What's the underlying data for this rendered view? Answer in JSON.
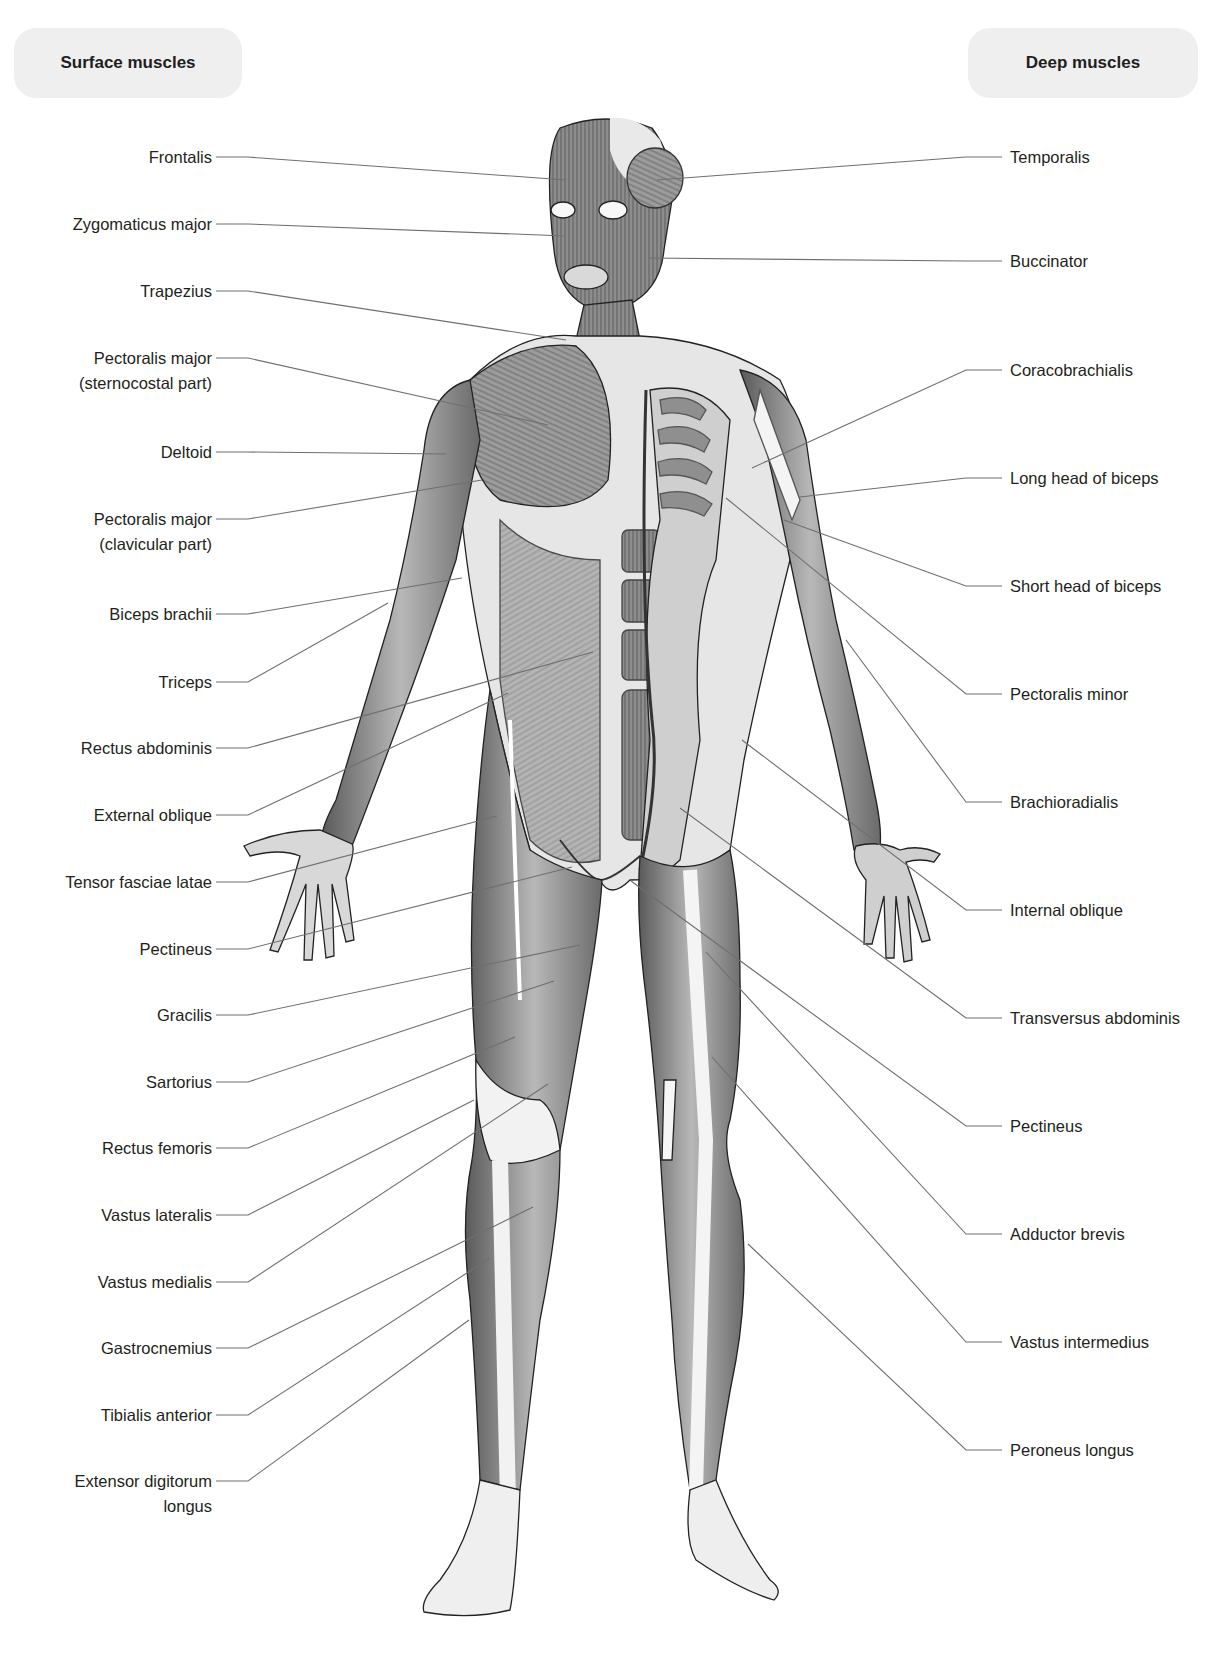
{
  "headers": {
    "left": "Surface muscles",
    "right": "Deep muscles"
  },
  "colors": {
    "pill_bg": "#efefef",
    "leader_line": "#6f6f6f",
    "label_text": "#231f20",
    "muscle_dark": "#5e5e5e",
    "muscle_mid": "#9a9a9a",
    "muscle_light": "#d6d6d6",
    "tendon": "#f4f4f4"
  },
  "surface_muscles": [
    {
      "label": "Frontalis",
      "y": 157,
      "target": [
        566,
        180
      ]
    },
    {
      "label": "Zygomaticus major",
      "y": 224,
      "target": [
        566,
        236
      ]
    },
    {
      "label": "Trapezius",
      "y": 291,
      "target": [
        566,
        340
      ]
    },
    {
      "label": "Pectoralis major",
      "label2": "(sternocostal part)",
      "y": 358,
      "target": [
        548,
        425
      ]
    },
    {
      "label": "Deltoid",
      "y": 452,
      "target": [
        446,
        454
      ]
    },
    {
      "label": "Pectoralis major",
      "label2": "(clavicular part)",
      "y": 519,
      "target": [
        482,
        480
      ]
    },
    {
      "label": "Biceps brachii",
      "y": 614,
      "target": [
        462,
        578
      ]
    },
    {
      "label": "Triceps",
      "y": 682,
      "target": [
        388,
        603
      ]
    },
    {
      "label": "Rectus abdominis",
      "y": 748,
      "target": [
        593,
        652
      ]
    },
    {
      "label": "External oblique",
      "y": 815,
      "target": [
        508,
        693
      ]
    },
    {
      "label": "Tensor fasciae latae",
      "y": 882,
      "target": [
        497,
        816
      ]
    },
    {
      "label": "Pectineus",
      "y": 949,
      "target": [
        572,
        867
      ]
    },
    {
      "label": "Gracilis",
      "y": 1015,
      "target": [
        580,
        945
      ]
    },
    {
      "label": "Sartorius",
      "y": 1082,
      "target": [
        554,
        981
      ]
    },
    {
      "label": "Rectus femoris",
      "y": 1148,
      "target": [
        515,
        1037
      ]
    },
    {
      "label": "Vastus lateralis",
      "y": 1215,
      "target": [
        474,
        1100
      ]
    },
    {
      "label": "Vastus medialis",
      "y": 1282,
      "target": [
        548,
        1084
      ]
    },
    {
      "label": "Gastrocnemius",
      "y": 1348,
      "target": [
        533,
        1207
      ]
    },
    {
      "label": "Tibialis anterior",
      "y": 1415,
      "target": [
        490,
        1258
      ]
    },
    {
      "label": "Extensor digitorum",
      "label2": "longus",
      "y": 1481,
      "target": [
        469,
        1320
      ]
    }
  ],
  "deep_muscles": [
    {
      "label": "Temporalis",
      "y": 157,
      "target": [
        657,
        180
      ]
    },
    {
      "label": "Buccinator",
      "y": 261,
      "target": [
        648,
        258
      ]
    },
    {
      "label": "Coracobrachialis",
      "y": 370,
      "target": [
        752,
        468
      ]
    },
    {
      "label": "Long head of biceps",
      "y": 478,
      "target": [
        800,
        497
      ]
    },
    {
      "label": "Short head of biceps",
      "y": 586,
      "target": [
        784,
        520
      ]
    },
    {
      "label": "Pectoralis minor",
      "y": 694,
      "target": [
        726,
        498
      ]
    },
    {
      "label": "Brachioradialis",
      "y": 802,
      "target": [
        846,
        640
      ]
    },
    {
      "label": "Internal oblique",
      "y": 910,
      "target": [
        742,
        740
      ]
    },
    {
      "label": "Transversus abdominis",
      "y": 1018,
      "target": [
        680,
        808
      ]
    },
    {
      "label": "Pectineus",
      "y": 1126,
      "target": [
        631,
        881
      ]
    },
    {
      "label": "Adductor brevis",
      "y": 1234,
      "target": [
        706,
        952
      ]
    },
    {
      "label": "Vastus intermedius",
      "y": 1342,
      "target": [
        712,
        1057
      ]
    },
    {
      "label": "Peroneus longus",
      "y": 1450,
      "target": [
        748,
        1244
      ]
    }
  ]
}
